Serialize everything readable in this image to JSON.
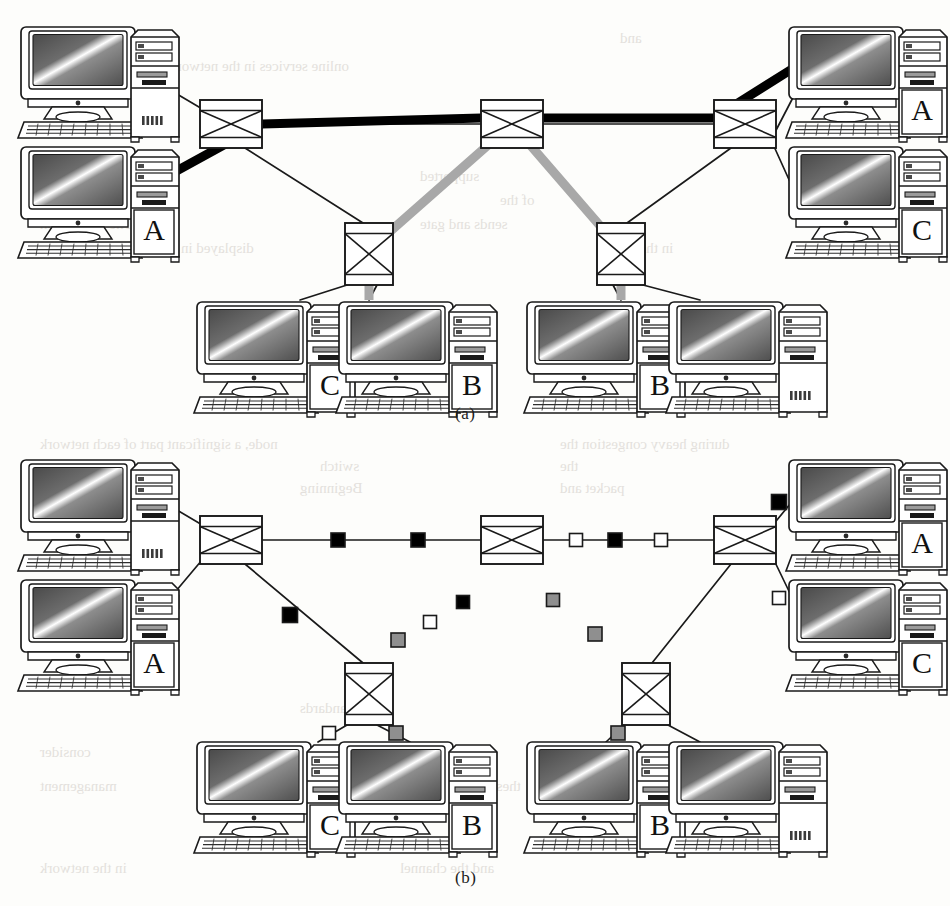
{
  "figure": {
    "panels": [
      {
        "id": "a",
        "caption": "(a)",
        "caption_x": 455,
        "caption_y": 404
      },
      {
        "id": "b",
        "caption": "(b)",
        "caption_x": 455,
        "caption_y": 868
      }
    ]
  },
  "colors": {
    "ink": "#1a1a1a",
    "line": "#1a1a1a",
    "thick_path": "#000000",
    "gray_path": "#a8a8a8",
    "marker_black": "#000000",
    "marker_white": "#ffffff",
    "marker_gray": "#8f8f8f",
    "screen_dark": "#5a5a5a",
    "screen_light": "#f2f2f2",
    "case_fill": "#ffffff",
    "page": "#fdfdfb"
  },
  "panel_a": {
    "switches": [
      {
        "name": "switch-top-left",
        "x": 200,
        "y": 100,
        "w": 62,
        "h": 48,
        "orient": "landscape"
      },
      {
        "name": "switch-top-center",
        "x": 481,
        "y": 100,
        "w": 62,
        "h": 48,
        "orient": "landscape"
      },
      {
        "name": "switch-top-right",
        "x": 714,
        "y": 100,
        "w": 62,
        "h": 48,
        "orient": "landscape"
      },
      {
        "name": "switch-bottom-left",
        "x": 345,
        "y": 223,
        "w": 48,
        "h": 62,
        "orient": "portrait"
      },
      {
        "name": "switch-bottom-right",
        "x": 597,
        "y": 223,
        "w": 48,
        "h": 62,
        "orient": "portrait"
      }
    ],
    "workstations": [
      {
        "name": "ws-top-left-1",
        "label": "",
        "x": 22,
        "y": 25,
        "side": "left"
      },
      {
        "name": "ws-top-left-2",
        "label": "A",
        "x": 22,
        "y": 145,
        "side": "left"
      },
      {
        "name": "ws-top-right-1",
        "label": "A",
        "x": 790,
        "y": 25,
        "side": "right"
      },
      {
        "name": "ws-top-right-2",
        "label": "C",
        "x": 790,
        "y": 145,
        "side": "right"
      },
      {
        "name": "ws-bottom-1",
        "label": "C",
        "x": 198,
        "y": 300,
        "side": "left"
      },
      {
        "name": "ws-bottom-2",
        "label": "B",
        "x": 340,
        "y": 300,
        "side": "left"
      },
      {
        "name": "ws-bottom-3",
        "label": "B",
        "x": 528,
        "y": 300,
        "side": "left"
      },
      {
        "name": "ws-bottom-4",
        "label": "",
        "x": 670,
        "y": 300,
        "side": "left"
      }
    ],
    "highlight_paths": [
      {
        "name": "path-thick-black",
        "color": "#000000",
        "width": 9,
        "points": "160,180 262,124 481,118 714,118 800,64",
        "note": "bold route from lower-left host A across top switches to upper-right host A"
      },
      {
        "name": "path-gray",
        "color": "#a8a8a8",
        "width": 9,
        "points": "369,300 369,250 512,124 621,250 621,300",
        "note": "gray route between the two hosts labelled B via the centre switch"
      }
    ]
  },
  "panel_b": {
    "y_offset": 410,
    "switches": [
      {
        "name": "switch-top-left",
        "x": 200,
        "y": 516,
        "w": 62,
        "h": 48,
        "orient": "landscape"
      },
      {
        "name": "switch-top-center",
        "x": 481,
        "y": 516,
        "w": 62,
        "h": 48,
        "orient": "landscape"
      },
      {
        "name": "switch-top-right",
        "x": 714,
        "y": 516,
        "w": 62,
        "h": 48,
        "orient": "landscape"
      },
      {
        "name": "switch-bottom-left",
        "x": 345,
        "y": 663,
        "w": 48,
        "h": 62,
        "orient": "portrait"
      },
      {
        "name": "switch-bottom-right",
        "x": 622,
        "y": 663,
        "w": 48,
        "h": 62,
        "orient": "portrait"
      }
    ],
    "workstations": [
      {
        "name": "ws-top-left-1",
        "label": "",
        "x": 22,
        "y": 458,
        "side": "left"
      },
      {
        "name": "ws-top-left-2",
        "label": "A",
        "x": 22,
        "y": 578,
        "side": "left"
      },
      {
        "name": "ws-top-right-1",
        "label": "A",
        "x": 790,
        "y": 458,
        "side": "right"
      },
      {
        "name": "ws-top-right-2",
        "label": "C",
        "x": 790,
        "y": 578,
        "side": "right"
      },
      {
        "name": "ws-bottom-1",
        "label": "C",
        "x": 198,
        "y": 740,
        "side": "left"
      },
      {
        "name": "ws-bottom-2",
        "label": "B",
        "x": 340,
        "y": 740,
        "side": "left"
      },
      {
        "name": "ws-bottom-3",
        "label": "B",
        "x": 528,
        "y": 740,
        "side": "left"
      },
      {
        "name": "ws-bottom-4",
        "label": "",
        "x": 670,
        "y": 740,
        "side": "left"
      }
    ],
    "markers": [
      {
        "name": "marker-top-seg1-a",
        "fill": "black",
        "x": 338,
        "y": 540,
        "size": 14
      },
      {
        "name": "marker-top-seg1-b",
        "fill": "black",
        "x": 418,
        "y": 540,
        "size": 14
      },
      {
        "name": "marker-top-seg2-a",
        "fill": "white",
        "x": 576,
        "y": 540,
        "size": 13
      },
      {
        "name": "marker-top-seg2-b",
        "fill": "black",
        "x": 615,
        "y": 540,
        "size": 14
      },
      {
        "name": "marker-top-seg2-c",
        "fill": "white",
        "x": 661,
        "y": 540,
        "size": 13
      },
      {
        "name": "marker-left-host",
        "fill": "black",
        "x": 172,
        "y": 602,
        "size": 13
      },
      {
        "name": "marker-left-diag",
        "fill": "black",
        "x": 290,
        "y": 615,
        "size": 15
      },
      {
        "name": "marker-left-diag2",
        "fill": "black",
        "x": 463,
        "y": 602,
        "size": 13
      },
      {
        "name": "marker-left-diag3",
        "fill": "white",
        "x": 430,
        "y": 622,
        "size": 13
      },
      {
        "name": "marker-left-diag4",
        "fill": "gray",
        "x": 398,
        "y": 640,
        "size": 14
      },
      {
        "name": "marker-right-diag1",
        "fill": "gray",
        "x": 553,
        "y": 600,
        "size": 13
      },
      {
        "name": "marker-right-diag2",
        "fill": "gray",
        "x": 595,
        "y": 634,
        "size": 14
      },
      {
        "name": "marker-right-host-a",
        "fill": "black",
        "x": 779,
        "y": 502,
        "size": 15
      },
      {
        "name": "marker-right-host-c",
        "fill": "white",
        "x": 779,
        "y": 598,
        "size": 13
      },
      {
        "name": "marker-bl-left",
        "fill": "white",
        "x": 329,
        "y": 733,
        "size": 13
      },
      {
        "name": "marker-bl-right",
        "fill": "gray",
        "x": 396,
        "y": 733,
        "size": 14
      },
      {
        "name": "marker-br-left",
        "fill": "gray",
        "x": 618,
        "y": 733,
        "size": 14
      }
    ]
  },
  "ghost_text": {
    "note": "faint bleed-through text from the reverse side of the printed page",
    "lines": [
      {
        "x": 40,
        "y": 30,
        "text": "systems. The computer"
      },
      {
        "x": 620,
        "y": 30,
        "text": "and"
      },
      {
        "x": 40,
        "y": 58,
        "text": "online services in the network in terms of operation"
      },
      {
        "x": 40,
        "y": 168,
        "text": "Communication"
      },
      {
        "x": 420,
        "y": 168,
        "text": "supported"
      },
      {
        "x": 40,
        "y": 192,
        "text": "are also organized in"
      },
      {
        "x": 500,
        "y": 192,
        "text": "of the"
      },
      {
        "x": 40,
        "y": 216,
        "text": "block. The destination"
      },
      {
        "x": 420,
        "y": 216,
        "text": "sends and gate"
      },
      {
        "x": 40,
        "y": 240,
        "text": "displayed in the LAN. The protocol"
      },
      {
        "x": 600,
        "y": 240,
        "text": "in the figure"
      },
      {
        "x": 40,
        "y": 436,
        "text": "node, a significant part of each network"
      },
      {
        "x": 560,
        "y": 436,
        "text": "during heavy congestion the"
      },
      {
        "x": 40,
        "y": 458,
        "text": "data buffer"
      },
      {
        "x": 320,
        "y": 458,
        "text": "switch"
      },
      {
        "x": 560,
        "y": 458,
        "text": "the"
      },
      {
        "x": 40,
        "y": 480,
        "text": "link for"
      },
      {
        "x": 300,
        "y": 480,
        "text": "Beginning"
      },
      {
        "x": 560,
        "y": 480,
        "text": "packet and"
      },
      {
        "x": 300,
        "y": 700,
        "text": "Standards"
      },
      {
        "x": 40,
        "y": 744,
        "text": "consider"
      },
      {
        "x": 300,
        "y": 744,
        "text": "a scheme"
      },
      {
        "x": 600,
        "y": 744,
        "text": "of table"
      },
      {
        "x": 40,
        "y": 778,
        "text": "management"
      },
      {
        "x": 420,
        "y": 778,
        "text": "these two entries"
      },
      {
        "x": 40,
        "y": 860,
        "text": "in the network"
      },
      {
        "x": 400,
        "y": 860,
        "text": "and the channel"
      }
    ]
  }
}
